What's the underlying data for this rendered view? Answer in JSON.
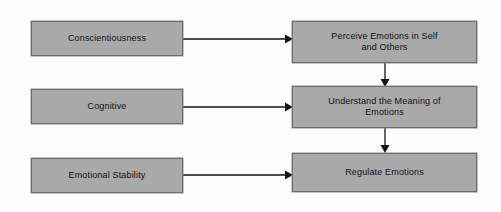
{
  "diagram": {
    "type": "flowchart",
    "background_color": "#fdfdfd",
    "node_fill_color": "#a9a9a9",
    "node_border_color": "#6e6e6e",
    "edge_color": "#151515",
    "text_color": "#121212",
    "antecedents": [
      {
        "id": "conscientiousness",
        "label": "Conscientiousness"
      },
      {
        "id": "cognitive",
        "label": "Cognitive"
      },
      {
        "id": "emotional-stability",
        "label": "Emotional Stability"
      }
    ],
    "outcomes": [
      {
        "id": "perceive-emotions",
        "label": "Perceive Emotions in Self\nand Others"
      },
      {
        "id": "understand-meaning",
        "label": "Understand the Meaning of\nEmotions"
      },
      {
        "id": "regulate-emotions",
        "label": "Regulate Emotions"
      }
    ],
    "edges": [
      {
        "id": "edge-conscientiousness-perceive",
        "from": "conscientiousness",
        "to": "perceive-emotions",
        "direction": "horizontal"
      },
      {
        "id": "edge-cognitive-understand",
        "from": "cognitive",
        "to": "understand-meaning",
        "direction": "horizontal"
      },
      {
        "id": "edge-stability-regulate",
        "from": "emotional-stability",
        "to": "regulate-emotions",
        "direction": "horizontal"
      },
      {
        "id": "edge-perceive-understand",
        "from": "perceive-emotions",
        "to": "understand-meaning",
        "direction": "vertical"
      },
      {
        "id": "edge-understand-regulate",
        "from": "understand-meaning",
        "to": "regulate-emotions",
        "direction": "vertical"
      }
    ]
  }
}
